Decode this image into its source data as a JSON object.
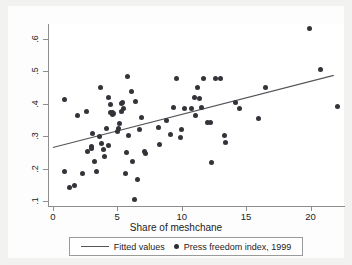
{
  "chart_data": {
    "type": "scatter",
    "title": "",
    "xlabel": "Share of meshchane",
    "ylabel": "",
    "xlim": [
      -0.3,
      22.6
    ],
    "ylim": [
      0.085,
      0.645
    ],
    "xticks": [
      0,
      5,
      10,
      15,
      20
    ],
    "xtick_labels": [
      "0",
      "5",
      "10",
      "15",
      "20"
    ],
    "yticks": [
      0.1,
      0.2,
      0.3,
      0.4,
      0.5,
      0.6
    ],
    "ytick_labels": [
      ".1",
      ".2",
      ".3",
      ".4",
      ".5",
      ".6"
    ],
    "grid": false,
    "legend_position": "bottom-center",
    "series": [
      {
        "name": "Press freedom index, 1999",
        "type": "scatter",
        "marker": "circle",
        "color": "#33333a",
        "points": [
          [
            0.9,
            0.412
          ],
          [
            0.9,
            0.191
          ],
          [
            1.3,
            0.141
          ],
          [
            1.7,
            0.148
          ],
          [
            1.9,
            0.363
          ],
          [
            2.3,
            0.185
          ],
          [
            2.6,
            0.375
          ],
          [
            2.7,
            0.253
          ],
          [
            3.0,
            0.267
          ],
          [
            3.0,
            0.263
          ],
          [
            3.1,
            0.308
          ],
          [
            3.2,
            0.222
          ],
          [
            3.4,
            0.191
          ],
          [
            3.6,
            0.299
          ],
          [
            3.7,
            0.449
          ],
          [
            3.8,
            0.276
          ],
          [
            3.9,
            0.258
          ],
          [
            4.0,
            0.238
          ],
          [
            4.2,
            0.322
          ],
          [
            4.3,
            0.271
          ],
          [
            4.3,
            0.419
          ],
          [
            4.5,
            0.396
          ],
          [
            4.5,
            0.372
          ],
          [
            4.6,
            0.374
          ],
          [
            4.6,
            0.368
          ],
          [
            4.7,
            0.369
          ],
          [
            5.0,
            0.314
          ],
          [
            5.1,
            0.322
          ],
          [
            5.2,
            0.34
          ],
          [
            5.3,
            0.377
          ],
          [
            5.3,
            0.399
          ],
          [
            5.4,
            0.404
          ],
          [
            5.5,
            0.385
          ],
          [
            5.6,
            0.185
          ],
          [
            5.7,
            0.249
          ],
          [
            5.8,
            0.482
          ],
          [
            5.9,
            0.303
          ],
          [
            6.1,
            0.436
          ],
          [
            6.2,
            0.222
          ],
          [
            6.3,
            0.104
          ],
          [
            6.4,
            0.406
          ],
          [
            6.6,
            0.168
          ],
          [
            6.7,
            0.319
          ],
          [
            6.9,
            0.358
          ],
          [
            7.1,
            0.254
          ],
          [
            7.2,
            0.248
          ],
          [
            8.2,
            0.327
          ],
          [
            8.3,
            0.275
          ],
          [
            8.8,
            0.348
          ],
          [
            9.1,
            0.305
          ],
          [
            9.4,
            0.389
          ],
          [
            9.6,
            0.477
          ],
          [
            9.9,
            0.295
          ],
          [
            10.0,
            0.321
          ],
          [
            10.2,
            0.386
          ],
          [
            10.8,
            0.385
          ],
          [
            11.0,
            0.418
          ],
          [
            11.1,
            0.365
          ],
          [
            11.2,
            0.451
          ],
          [
            11.4,
            0.415
          ],
          [
            11.5,
            0.388
          ],
          [
            11.7,
            0.478
          ],
          [
            12.0,
            0.342
          ],
          [
            12.2,
            0.341
          ],
          [
            12.3,
            0.219
          ],
          [
            12.6,
            0.478
          ],
          [
            13.0,
            0.478
          ],
          [
            13.3,
            0.301
          ],
          [
            13.4,
            0.281
          ],
          [
            14.2,
            0.402
          ],
          [
            14.5,
            0.384
          ],
          [
            16.0,
            0.354
          ],
          [
            16.5,
            0.449
          ],
          [
            19.9,
            0.63
          ],
          [
            20.8,
            0.505
          ],
          [
            22.1,
            0.39
          ]
        ]
      },
      {
        "name": "Fitted values",
        "type": "line",
        "color": "#55555a",
        "endpoints": [
          [
            0.0,
            0.265
          ],
          [
            21.8,
            0.487
          ]
        ]
      }
    ]
  },
  "legend": {
    "entries": [
      {
        "label": "Fitted values",
        "marker": "line"
      },
      {
        "label": "Press freedom index, 1999",
        "marker": "dot"
      }
    ]
  }
}
